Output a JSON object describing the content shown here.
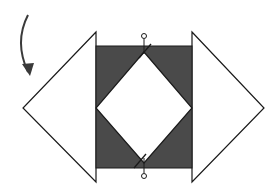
{
  "diagram": {
    "colors": {
      "background": "#ffffff",
      "fill_dark": "#4a4a4a",
      "fill_light": "#ffffff",
      "stroke": "#1a1a1a",
      "arrow": "#3a3a3a"
    },
    "shapes": {
      "left_triangle": {
        "points": "96,32 23,108 96,182"
      },
      "right_triangle": {
        "points": "192,32 264,108 192,182"
      },
      "center_rect": {
        "x": 96,
        "y": 46,
        "width": 96,
        "height": 122
      },
      "center_diamond": {
        "points": "144,52 192,108 144,163 96,108"
      }
    },
    "markers": {
      "top": {
        "circle_cx": 144,
        "circle_cy": 36,
        "r": 2.5,
        "tick_x": 144,
        "tick_y1": 39,
        "tick_y2": 54,
        "slash": "139,58 151,44"
      },
      "bottom": {
        "circle_cx": 144,
        "circle_cy": 176,
        "r": 2.5,
        "tick_x": 144,
        "tick_y1": 158,
        "tick_y2": 173,
        "slash": "134,168 146,154"
      }
    },
    "arrow": {
      "path": "M 28 15 Q 14 42 28 72",
      "head": "22,64 30,76 34,64",
      "meaning": "rotate / fold direction"
    }
  }
}
